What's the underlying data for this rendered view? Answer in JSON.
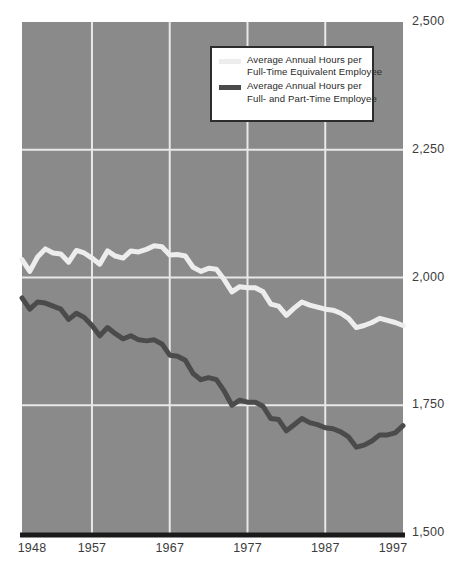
{
  "chart_data": {
    "type": "line",
    "title": "",
    "subtitle": "",
    "xlabel": "",
    "ylabel": "",
    "xlim": [
      1948,
      1997
    ],
    "ylim": [
      1500,
      2500
    ],
    "grid": true,
    "legend_position": "top-center",
    "background_color": "#8a8a8a",
    "gridline_color": "#e8e8e8",
    "axis_line_color": "#1a1a1a",
    "x_ticks": [
      "1948",
      "1957",
      "1967",
      "1977",
      "1987",
      "1997"
    ],
    "x_tick_values": [
      1948,
      1957,
      1967,
      1977,
      1987,
      1997
    ],
    "y_ticks": [
      "2,500",
      "2,250",
      "2,000",
      "1,750",
      "1,500"
    ],
    "y_tick_values": [
      2500,
      2250,
      2000,
      1750,
      1500
    ],
    "series": [
      {
        "name": "Average Annual Hours per Full-Time Equivalent Employee",
        "color": "#ededed",
        "x": [
          1948,
          1949,
          1950,
          1951,
          1952,
          1953,
          1954,
          1955,
          1956,
          1957,
          1958,
          1959,
          1960,
          1961,
          1962,
          1963,
          1964,
          1965,
          1966,
          1967,
          1968,
          1969,
          1970,
          1971,
          1972,
          1973,
          1974,
          1975,
          1976,
          1977,
          1978,
          1979,
          1980,
          1981,
          1982,
          1983,
          1984,
          1985,
          1986,
          1987,
          1988,
          1989,
          1990,
          1991,
          1992,
          1993,
          1994,
          1995,
          1996,
          1997
        ],
        "values": [
          2035,
          2012,
          2040,
          2056,
          2048,
          2046,
          2030,
          2053,
          2048,
          2038,
          2026,
          2052,
          2042,
          2038,
          2052,
          2050,
          2055,
          2062,
          2060,
          2044,
          2045,
          2042,
          2020,
          2012,
          2018,
          2016,
          1996,
          1972,
          1982,
          1980,
          1980,
          1972,
          1948,
          1944,
          1926,
          1940,
          1952,
          1946,
          1942,
          1938,
          1936,
          1930,
          1920,
          1902,
          1906,
          1912,
          1920,
          1916,
          1912,
          1906
        ]
      },
      {
        "name": "Average Annual Hours per Full- and Part-Time Employee",
        "color": "#4b4b4b",
        "x": [
          1948,
          1949,
          1950,
          1951,
          1952,
          1953,
          1954,
          1955,
          1956,
          1957,
          1958,
          1959,
          1960,
          1961,
          1962,
          1963,
          1964,
          1965,
          1966,
          1967,
          1968,
          1969,
          1970,
          1971,
          1972,
          1973,
          1974,
          1975,
          1976,
          1977,
          1978,
          1979,
          1980,
          1981,
          1982,
          1983,
          1984,
          1985,
          1986,
          1987,
          1988,
          1989,
          1990,
          1991,
          1992,
          1993,
          1994,
          1995,
          1996,
          1997
        ],
        "values": [
          1960,
          1938,
          1952,
          1950,
          1944,
          1938,
          1918,
          1930,
          1922,
          1906,
          1886,
          1902,
          1890,
          1880,
          1886,
          1878,
          1876,
          1878,
          1870,
          1848,
          1846,
          1838,
          1812,
          1800,
          1804,
          1800,
          1778,
          1750,
          1760,
          1756,
          1756,
          1748,
          1724,
          1722,
          1700,
          1712,
          1724,
          1716,
          1712,
          1706,
          1704,
          1698,
          1688,
          1668,
          1672,
          1680,
          1692,
          1692,
          1696,
          1710
        ]
      }
    ]
  },
  "legend": {
    "entries": [
      {
        "swatch": "light",
        "line1": "Average Annual Hours per",
        "line2": "Full-Time Equivalent Employee"
      },
      {
        "swatch": "dark",
        "line1": "Average Annual Hours per",
        "line2": "Full- and Part-Time Employee"
      }
    ]
  }
}
